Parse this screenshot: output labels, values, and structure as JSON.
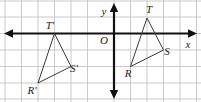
{
  "figure": {
    "background_color": "#ffffff",
    "width": 201,
    "height": 102
  },
  "grid": {
    "line_color": "#c9c9cf",
    "cell_size_px": 16.5,
    "vertical_lines_px": [
      5,
      21.5,
      38,
      54.5,
      71,
      87.5,
      114,
      130.5,
      147,
      163.5,
      180,
      196.5
    ],
    "horizontal_lines_px": [
      1,
      17,
      33.5,
      50,
      66.5,
      83,
      99
    ],
    "visible": true
  },
  "axes": {
    "color": "#111111",
    "x_axis": {
      "label": "x",
      "label_pos_px": [
        188,
        48
      ],
      "y_px": 33.5,
      "x_start_px": 4,
      "x_end_px": 197,
      "arrow_left": true,
      "arrow_right": true
    },
    "y_axis": {
      "label": "y",
      "label_pos_px": [
        104,
        15
      ],
      "x_px": 114,
      "y_start_px": 3,
      "y_end_px": 99,
      "arrow_up": true,
      "arrow_down": true
    },
    "origin": {
      "label": "O",
      "label_pos_px": [
        104,
        44
      ],
      "point_px": [
        114,
        33.5
      ]
    }
  },
  "shapes": [
    {
      "name": "triangle-rst",
      "id": "preimage",
      "stroke_color": "#3a3a3a",
      "stroke_width": 1,
      "fill": "none",
      "vertices": [
        {
          "label": "T",
          "x_px": 147,
          "y_px": 18,
          "label_x_px": 149,
          "label_y_px": 13,
          "grid_x": 2,
          "grid_y": 1
        },
        {
          "label": "S",
          "x_px": 163.5,
          "y_px": 50,
          "label_x_px": 167,
          "label_y_px": 55,
          "grid_x": 3,
          "grid_y": -1
        },
        {
          "label": "R",
          "x_px": 130.5,
          "y_px": 66.5,
          "label_x_px": 128,
          "label_y_px": 77,
          "grid_x": 1,
          "grid_y": -2
        }
      ]
    },
    {
      "name": "triangle-rst-prime",
      "id": "image",
      "stroke_color": "#3a3a3a",
      "stroke_width": 1,
      "fill": "none",
      "vertices": [
        {
          "label": "T'",
          "x_px": 54.5,
          "y_px": 33.5,
          "label_x_px": 50,
          "label_y_px": 29,
          "grid_x": -4,
          "grid_y": 0
        },
        {
          "label": "S'",
          "x_px": 71,
          "y_px": 66.5,
          "label_x_px": 74,
          "label_y_px": 72,
          "grid_x": -3,
          "grid_y": -2
        },
        {
          "label": "R'",
          "x_px": 38,
          "y_px": 83,
          "label_x_px": 32,
          "label_y_px": 94,
          "grid_x": -5,
          "grid_y": -3
        }
      ]
    }
  ]
}
